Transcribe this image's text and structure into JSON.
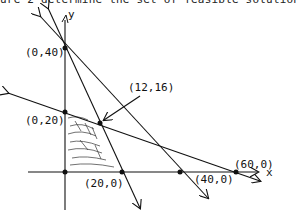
{
  "caption": "ure 2 determine the set of feasible solutions.",
  "axes": {
    "x_label": "x",
    "y_label": "y"
  },
  "points": [
    {
      "label": "(0,40)",
      "x": 0,
      "y": 40
    },
    {
      "label": "(0,20)",
      "x": 0,
      "y": 20
    },
    {
      "label": "(12,16)",
      "x": 12,
      "y": 16
    },
    {
      "label": "(20,0)",
      "x": 20,
      "y": 0
    },
    {
      "label": "(40,0)",
      "x": 40,
      "y": 0
    },
    {
      "label": "(60,0)",
      "x": 60,
      "y": 0
    }
  ],
  "lines": [
    {
      "through": [
        "(0,40)",
        "(20,0)"
      ]
    },
    {
      "through": [
        "(0,40)",
        "(40,0)"
      ]
    },
    {
      "through": [
        "(0,20)",
        "(60,0)"
      ]
    }
  ],
  "feasible_region": [
    "(0,0)",
    "(0,20)",
    "(12,16)",
    "(20,0)"
  ],
  "colors": {
    "ink": "#111111",
    "background": "#ffffff"
  }
}
